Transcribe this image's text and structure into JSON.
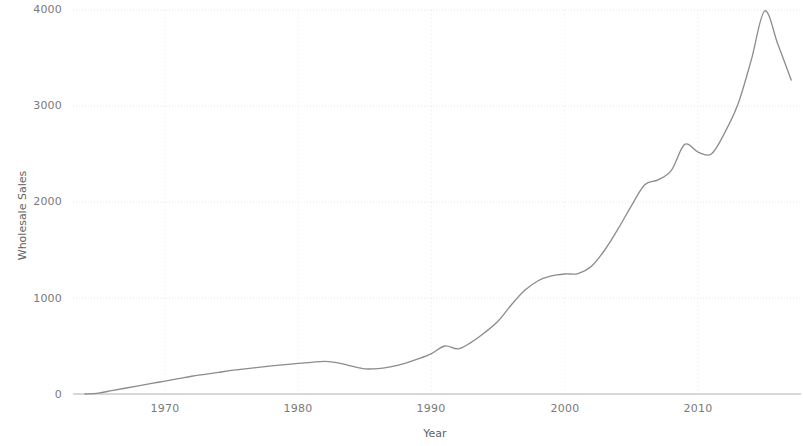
{
  "chart_data": {
    "type": "line",
    "title": "",
    "xlabel": "Year",
    "ylabel": "Wholesale Sales",
    "xlim": [
      1964,
      2017
    ],
    "ylim": [
      0,
      4100
    ],
    "grid": true,
    "legend": "none",
    "line_color": "#8c8c8c",
    "x_ticks": [
      "1970",
      "1980",
      "1990",
      "2000",
      "2010"
    ],
    "x_tick_values": [
      1970,
      1980,
      1990,
      2000,
      2010
    ],
    "y_ticks": [
      "0",
      "1000",
      "2000",
      "3000",
      "4000"
    ],
    "y_tick_values": [
      0,
      1000,
      2000,
      3000,
      4000
    ],
    "x": [
      1964,
      1965,
      1966,
      1967,
      1968,
      1969,
      1970,
      1971,
      1972,
      1973,
      1974,
      1975,
      1976,
      1977,
      1978,
      1979,
      1980,
      1981,
      1982,
      1983,
      1984,
      1985,
      1986,
      1987,
      1988,
      1989,
      1990,
      1991,
      1992,
      1993,
      1994,
      1995,
      1996,
      1997,
      1998,
      1999,
      2000,
      2001,
      2002,
      2003,
      2004,
      2005,
      2006,
      2007,
      2008,
      2009,
      2010,
      2011,
      2012,
      2013,
      2014,
      2015,
      2016,
      2017
    ],
    "values": [
      0,
      10,
      35,
      60,
      85,
      110,
      135,
      160,
      185,
      205,
      225,
      245,
      262,
      278,
      292,
      305,
      318,
      330,
      340,
      325,
      290,
      262,
      265,
      285,
      320,
      365,
      420,
      500,
      470,
      540,
      640,
      760,
      930,
      1080,
      1180,
      1230,
      1250,
      1255,
      1330,
      1500,
      1720,
      1960,
      2180,
      2230,
      2330,
      2600,
      2520,
      2500,
      2720,
      3020,
      3480,
      3990,
      3640,
      3270
    ],
    "series_name": "Wholesale Sales"
  },
  "axes": {
    "y_title": "Wholesale Sales",
    "x_title": "Year"
  }
}
